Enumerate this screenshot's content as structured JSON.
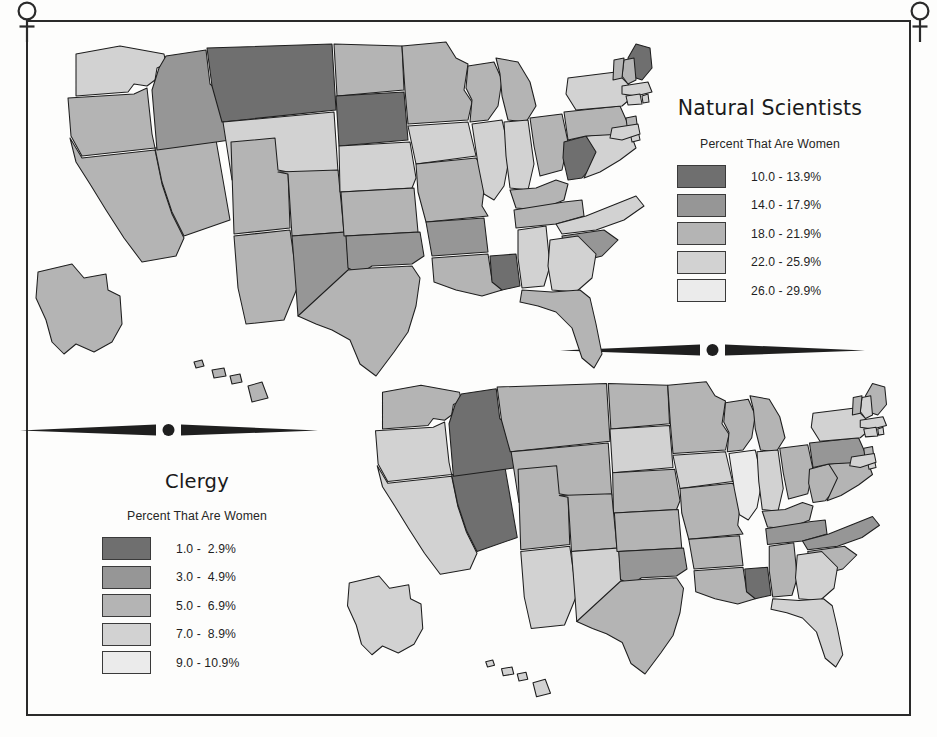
{
  "figure": {
    "background_color": "#fdfdfc",
    "frame_color": "#2a2a2a",
    "corner_icon": "venus-female-symbol",
    "divider_icon": "spindle-rule-ornament"
  },
  "palette": {
    "class_1": "#6f6f6f",
    "class_2": "#969696",
    "class_3": "#b4b4b4",
    "class_4": "#d2d2d2",
    "class_5": "#ebebeb",
    "outline": "#1e1e1e"
  },
  "panels": {
    "upper": {
      "title": "Natural Scientists",
      "subtitle": "Percent That Are Women",
      "legend": [
        {
          "label": "10.0 - 13.9%",
          "color": "#6f6f6f"
        },
        {
          "label": "14.0 - 17.9%",
          "color": "#969696"
        },
        {
          "label": "18.0 - 21.9%",
          "color": "#b4b4b4"
        },
        {
          "label": "22.0 - 25.9%",
          "color": "#d2d2d2"
        },
        {
          "label": "26.0 - 29.9%",
          "color": "#ebebeb"
        }
      ]
    },
    "lower": {
      "title": "Clergy",
      "subtitle": "Percent That Are Women",
      "legend": [
        {
          "label": "1.0 -  2.9%",
          "color": "#6f6f6f"
        },
        {
          "label": "3.0 -  4.9%",
          "color": "#969696"
        },
        {
          "label": "5.0 -  6.9%",
          "color": "#b4b4b4"
        },
        {
          "label": "7.0 -  8.9%",
          "color": "#d2d2d2"
        },
        {
          "label": "9.0 - 10.9%",
          "color": "#ebebeb"
        }
      ]
    }
  },
  "chart_data": [
    {
      "type": "choropleth",
      "title": "Natural Scientists",
      "subtitle": "Percent That Are Women",
      "unit": "percent",
      "classes": [
        "10.0 - 13.9%",
        "14.0 - 17.9%",
        "18.0 - 21.9%",
        "22.0 - 25.9%",
        "26.0 - 29.9%"
      ],
      "class_colors": [
        "#6f6f6f",
        "#969696",
        "#b4b4b4",
        "#d2d2d2",
        "#ebebeb"
      ],
      "legend_position": "right",
      "values": {
        "WA": 4,
        "OR": 3,
        "CA": 3,
        "NV": 3,
        "ID": 2,
        "MT": 1,
        "WY": 4,
        "UT": 3,
        "AZ": 3,
        "CO": 3,
        "NM": 2,
        "ND": 3,
        "SD": 1,
        "NE": 4,
        "KS": 3,
        "OK": 2,
        "TX": 3,
        "MN": 3,
        "IA": 4,
        "MO": 3,
        "AR": 2,
        "LA": 3,
        "WI": 3,
        "IL": 4,
        "MS": 1,
        "MI": 3,
        "IN": 4,
        "KY": 3,
        "TN": 3,
        "AL": 4,
        "OH": 3,
        "WV": 1,
        "VA": 4,
        "NC": 4,
        "SC": 2,
        "GA": 4,
        "FL": 3,
        "PA": 3,
        "NY": 4,
        "ME": 1,
        "NH": 3,
        "VT": 3,
        "MA": 4,
        "RI": 4,
        "CT": 4,
        "NJ": 3,
        "DE": 4,
        "MD": 4,
        "AK": 3,
        "HI": 3
      }
    },
    {
      "type": "choropleth",
      "title": "Clergy",
      "subtitle": "Percent That Are Women",
      "unit": "percent",
      "classes": [
        "1.0 -  2.9%",
        "3.0 -  4.9%",
        "5.0 -  6.9%",
        "7.0 -  8.9%",
        "9.0 - 10.9%"
      ],
      "class_colors": [
        "#6f6f6f",
        "#969696",
        "#b4b4b4",
        "#d2d2d2",
        "#ebebeb"
      ],
      "legend_position": "left",
      "values": {
        "WA": 3,
        "OR": 4,
        "CA": 4,
        "NV": 1,
        "ID": 1,
        "MT": 3,
        "WY": 3,
        "UT": 3,
        "AZ": 4,
        "CO": 3,
        "NM": 4,
        "ND": 3,
        "SD": 4,
        "NE": 3,
        "KS": 3,
        "OK": 2,
        "TX": 3,
        "MN": 3,
        "IA": 4,
        "MO": 3,
        "AR": 3,
        "LA": 3,
        "WI": 3,
        "IL": 5,
        "MS": 1,
        "MI": 3,
        "IN": 4,
        "KY": 3,
        "TN": 2,
        "AL": 3,
        "OH": 3,
        "WV": 3,
        "VA": 3,
        "NC": 2,
        "SC": 3,
        "GA": 4,
        "FL": 4,
        "PA": 2,
        "NY": 4,
        "ME": 3,
        "NH": 4,
        "VT": 3,
        "MA": 4,
        "RI": 4,
        "CT": 4,
        "NJ": 3,
        "DE": 4,
        "MD": 4,
        "AK": 4,
        "HI": 4
      }
    }
  ]
}
